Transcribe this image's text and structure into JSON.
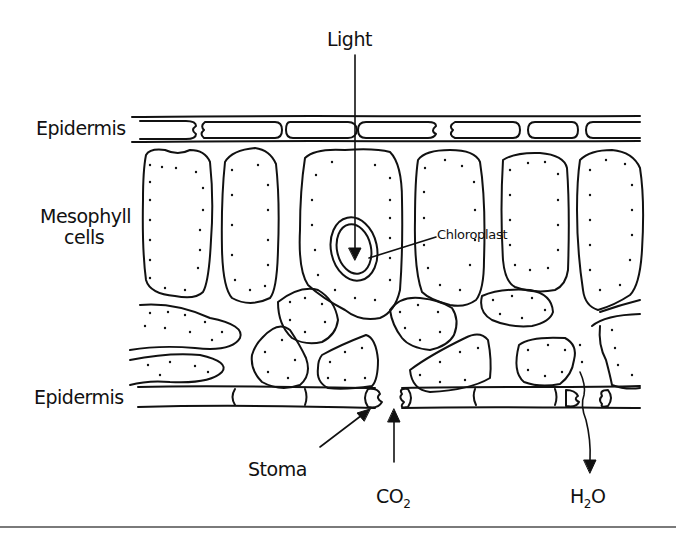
{
  "diagram": {
    "labels": {
      "light": "Light",
      "epidermis_top": "Epidermis",
      "mesophyll_line1": "Mesophyll",
      "mesophyll_line2": "cells",
      "chloroplast": "Chloroplast",
      "epidermis_bottom": "Epidermis",
      "stoma": "Stoma",
      "co2_main": "CO",
      "co2_sub": "2",
      "h2o_h": "H",
      "h2o_sub": "2",
      "h2o_o": "O"
    },
    "colors": {
      "ink": "#111111",
      "background": "#ffffff",
      "rule": "#7a7a7a"
    },
    "arrows": [
      {
        "name": "light-arrow",
        "direction": "down",
        "from": "Light",
        "to": "Chloroplast"
      },
      {
        "name": "stoma-pointer",
        "direction": "up-right",
        "from": "Stoma label",
        "to": "guard cell"
      },
      {
        "name": "co2-arrow",
        "direction": "up",
        "from": "CO2",
        "to": "stoma opening"
      },
      {
        "name": "h2o-arrow",
        "direction": "down",
        "from": "leaf interior",
        "to": "H2O"
      }
    ]
  }
}
